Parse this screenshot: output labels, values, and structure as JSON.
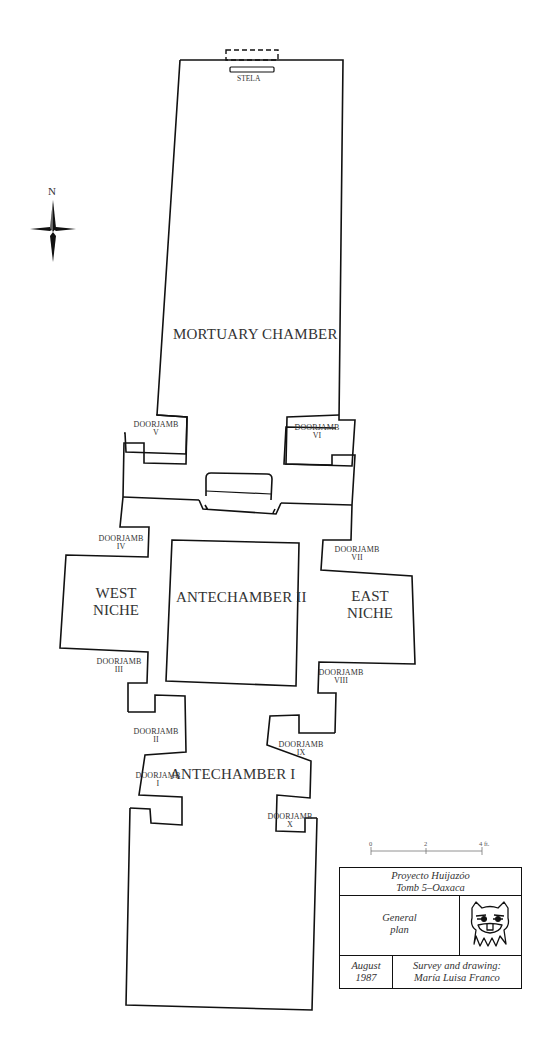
{
  "plan": {
    "title": "Tomb 5 general plan",
    "north_label": "N",
    "stela_label": "STELA",
    "rooms": {
      "mortuary_chamber": "MORTUARY CHAMBER",
      "antechamber_2": "ANTECHAMBER II",
      "antechamber_1": "ANTECHAMBER I",
      "west_niche_line1": "WEST",
      "west_niche_line2": "NICHE",
      "east_niche_line1": "EAST",
      "east_niche_line2": "NICHE"
    },
    "doorjambs": [
      {
        "label": "DOORJAMB",
        "numeral": "I"
      },
      {
        "label": "DOORJAMB",
        "numeral": "II"
      },
      {
        "label": "DOORJAMB",
        "numeral": "III"
      },
      {
        "label": "DOORJAMB",
        "numeral": "IV"
      },
      {
        "label": "DOORJAMB",
        "numeral": "V"
      },
      {
        "label": "DOORJAMB",
        "numeral": "VI"
      },
      {
        "label": "DOORJAMB",
        "numeral": "VII"
      },
      {
        "label": "DOORJAMB",
        "numeral": "VIII"
      },
      {
        "label": "DOORJAMB",
        "numeral": "IX"
      },
      {
        "label": "DOORJAMB",
        "numeral": "X"
      }
    ]
  },
  "scale_bar": {
    "ticks": [
      "0",
      "2",
      "4 ft."
    ]
  },
  "title_block": {
    "project_line1": "Proyecto Huijazóo",
    "project_line2": "Tomb 5–Oaxaca",
    "plan_line1": "General",
    "plan_line2": "plan",
    "date_line1": "August",
    "date_line2": "1987",
    "credit_line1": "Survey and drawing:",
    "credit_line2": "María Luisa Franco",
    "logo_icon": "zapotec-mask-icon"
  },
  "colors": {
    "line": "#111111",
    "text": "#333333",
    "background": "#ffffff"
  }
}
